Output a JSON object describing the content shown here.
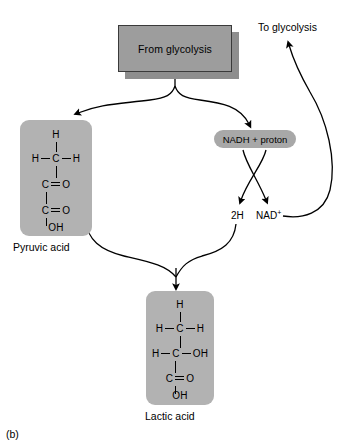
{
  "figure": {
    "caption": "(b)",
    "title_box": "From glycolysis",
    "to_glycolysis": "To glycolysis"
  },
  "nodes": {
    "nadh": "NADH + proton",
    "two_h": "2H",
    "nad_plus_base": "NAD",
    "nad_plus_sup": "+"
  },
  "molecules": [
    {
      "id": "pyruvic",
      "caption": "Pyruvic acid",
      "rows": [
        {
          "left": "",
          "center": "H",
          "right": ""
        },
        {
          "left": "H",
          "center": "C",
          "right": "H"
        },
        {
          "left": "",
          "center": "C",
          "right": "O"
        },
        {
          "left": "",
          "center": "C",
          "right": "O"
        },
        {
          "left": "",
          "center": "OH",
          "right": ""
        }
      ]
    },
    {
      "id": "lactic",
      "caption": "Lactic acid",
      "rows": [
        {
          "left": "",
          "center": "H",
          "right": ""
        },
        {
          "left": "H",
          "center": "C",
          "right": "H"
        },
        {
          "left": "H",
          "center": "C",
          "right": "OH"
        },
        {
          "left": "",
          "center": "C",
          "right": "O"
        },
        {
          "left": "",
          "center": "OH",
          "right": ""
        }
      ]
    }
  ],
  "colors": {
    "box_fill": "#9d9d9d",
    "box_border": "#3a3a3a",
    "box_shadow": "#8e8e8e",
    "molecule_fill": "#b2b2b2",
    "pill_fill": "#a8a8a8",
    "stroke": "#000000",
    "background": "#ffffff"
  }
}
